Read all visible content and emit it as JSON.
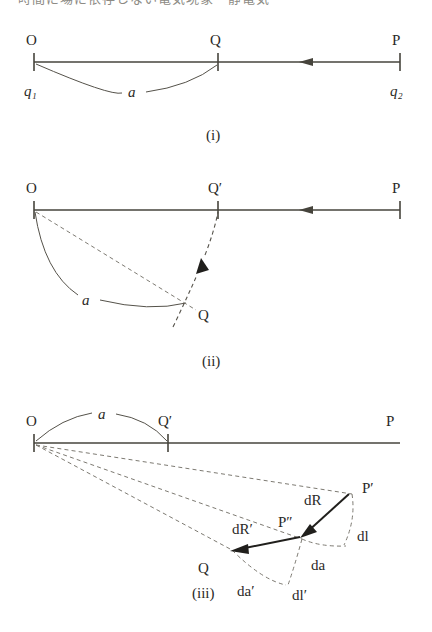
{
  "page": {
    "width": 432,
    "height": 632,
    "background": "#ffffff",
    "ink_color": "#2b2a27",
    "line_color": "#46443c",
    "dashed_color": "#7d7a72",
    "vector_color": "#201f1c",
    "cropped_header_text": "時間に場に依存しない電気現象・静電気"
  },
  "figures": [
    {
      "id": "i",
      "caption": "(i)",
      "labels": {
        "origin": "O",
        "charge_left": "q₁",
        "midpoint": "Q",
        "far_point": "P",
        "charge_right": "q₂",
        "arc": "a"
      },
      "geometry": {
        "axis_y": 62,
        "x_O": 34,
        "x_Q": 218,
        "x_P": 400,
        "arrow_tip_x": 300,
        "arc_sag": 22
      }
    },
    {
      "id": "ii",
      "caption": "(ii)",
      "labels": {
        "origin": "O",
        "displaced_point": "Q′",
        "far_point": "P",
        "swung_point": "Q",
        "arc": "a"
      },
      "geometry": {
        "axis_y": 210,
        "x_O": 34,
        "x_Qprime": 218,
        "x_P": 400,
        "arrow_tip_x": 300,
        "Q_x": 188,
        "Q_y": 303
      }
    },
    {
      "id": "iii",
      "caption": "(iii)",
      "labels": {
        "origin": "O",
        "displaced_point": "Q′",
        "far_point": "P",
        "swung_point": "Q",
        "p_prime": "P′",
        "p_double_prime": "P″",
        "arc": "a",
        "vector_dR": "dR",
        "vector_dR_prime": "dR′",
        "seg_dl": "dl",
        "seg_dl_prime": "dl′",
        "seg_da_right": "da",
        "seg_da_bottom": "da′"
      },
      "geometry": {
        "axis_y": 443,
        "x_O": 34,
        "x_Qprime": 168,
        "x_P_end": 400,
        "Pprime_x": 348,
        "Pprime_y": 492,
        "Pdprime_x": 300,
        "Pdprime_y": 537,
        "Q_x": 228,
        "Q_y": 551
      }
    }
  ]
}
